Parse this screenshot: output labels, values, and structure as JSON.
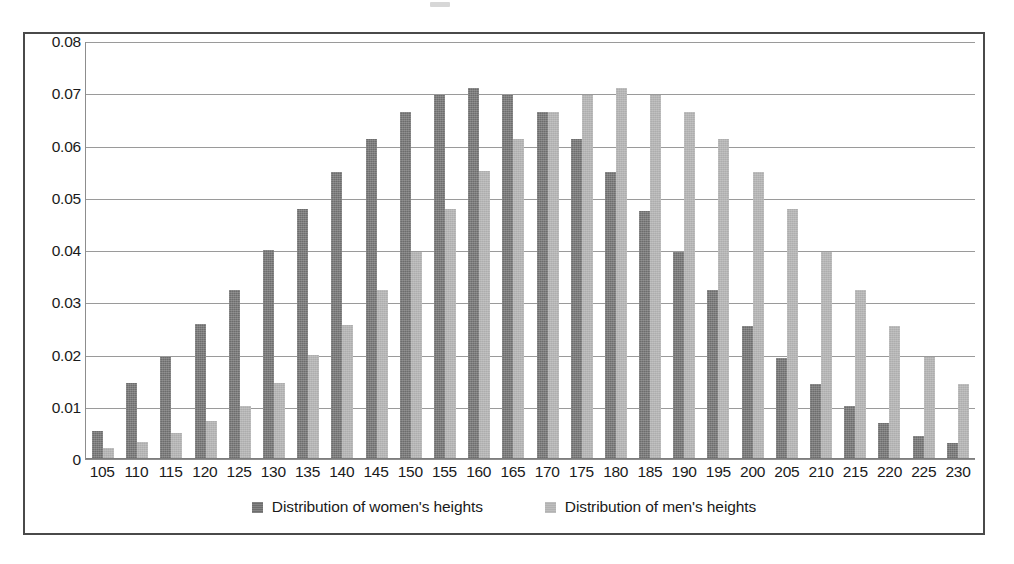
{
  "chart_data": {
    "type": "bar",
    "title": "",
    "subtitle": "",
    "xlabel": "",
    "ylabel": "",
    "ylim": [
      0,
      0.08
    ],
    "ytick_labels": [
      "0.08",
      "0.07",
      "0.06",
      "0.05",
      "0.04",
      "0.03",
      "0.02",
      "0.01",
      "0"
    ],
    "ytick_values": [
      0.08,
      0.07,
      0.06,
      0.05,
      0.04,
      0.03,
      0.02,
      0.01,
      0
    ],
    "grid": true,
    "legend_position": "bottom",
    "categories": [
      "105",
      "110",
      "115",
      "120",
      "125",
      "130",
      "135",
      "140",
      "145",
      "150",
      "155",
      "160",
      "165",
      "170",
      "175",
      "180",
      "185",
      "190",
      "195",
      "200",
      "205",
      "210",
      "215",
      "220",
      "225",
      "230"
    ],
    "series": [
      {
        "name": "Distribution of women's heights",
        "color": "#6d6d6d",
        "values": [
          0.0053,
          0.0146,
          0.0196,
          0.0258,
          0.0324,
          0.04,
          0.0478,
          0.0549,
          0.0613,
          0.0665,
          0.0697,
          0.071,
          0.0697,
          0.0665,
          0.0613,
          0.0549,
          0.0475,
          0.0397,
          0.0324,
          0.0254,
          0.0193,
          0.0144,
          0.0102,
          0.0069,
          0.0045,
          0.003
        ]
      },
      {
        "name": "Distribution of men's heights",
        "color": "#adadad",
        "values": [
          0.0022,
          0.0033,
          0.0049,
          0.0072,
          0.0102,
          0.0146,
          0.02,
          0.0256,
          0.0324,
          0.0397,
          0.0478,
          0.0551,
          0.0613,
          0.0665,
          0.0697,
          0.071,
          0.0697,
          0.0665,
          0.0613,
          0.0549,
          0.0478,
          0.0397,
          0.0324,
          0.0254,
          0.0195,
          0.0144
        ]
      }
    ]
  },
  "legend": {
    "entries": [
      {
        "label": "Distribution of women's heights",
        "swatch": "women-swatch-icon"
      },
      {
        "label": "Distribution of men's heights",
        "swatch": "men-swatch-icon"
      }
    ]
  }
}
